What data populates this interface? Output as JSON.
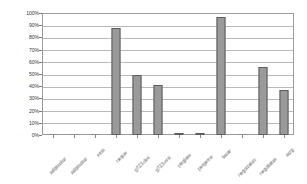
{
  "chart_data": {
    "type": "bar",
    "title": "",
    "subtitle": "",
    "xlabel": "",
    "ylabel": "",
    "ylim": [
      0,
      100
    ],
    "grid": true,
    "legend": false,
    "legend_position": "none",
    "value_suffix": "%",
    "bar_color": "#9a9a9a",
    "bar_border_color": "#5d5d5d",
    "gridline_color": "#b9b9b9",
    "axis_color": "#9b9b9b",
    "ytick_labels": [
      "100%",
      "90%",
      "80%",
      "70%",
      "60%",
      "50%",
      "40%",
      "30%",
      "20%",
      "10%",
      "0%"
    ],
    "ytick_values": [
      100,
      90,
      80,
      70,
      60,
      50,
      40,
      30,
      20,
      10,
      0
    ],
    "categories": [
      "adipiscitur",
      "adipiscitur",
      "eros",
      "neque",
      "g723.dec",
      "g723.enc",
      "pinglate",
      "pergemo",
      "lauar",
      "negociatus",
      "negotiatus",
      "acrg"
    ],
    "values": [
      0,
      0,
      0,
      88,
      49,
      41,
      2,
      2,
      97,
      0,
      56,
      37
    ],
    "annotations": []
  }
}
